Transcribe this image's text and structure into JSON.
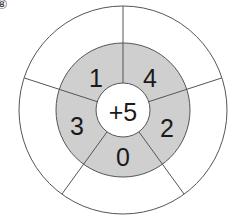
{
  "problem_number": "⑧",
  "wheel": {
    "center": "+5",
    "inner_ring": [
      "1",
      "4",
      "2",
      "0",
      "3"
    ],
    "outer_ring": [
      "",
      "",
      "",
      "",
      ""
    ],
    "colors": {
      "inner_ring_fill": "#cfcfcf",
      "center_fill": "#ffffff",
      "outer_fill": "#ffffff",
      "stroke": "#444444"
    }
  }
}
